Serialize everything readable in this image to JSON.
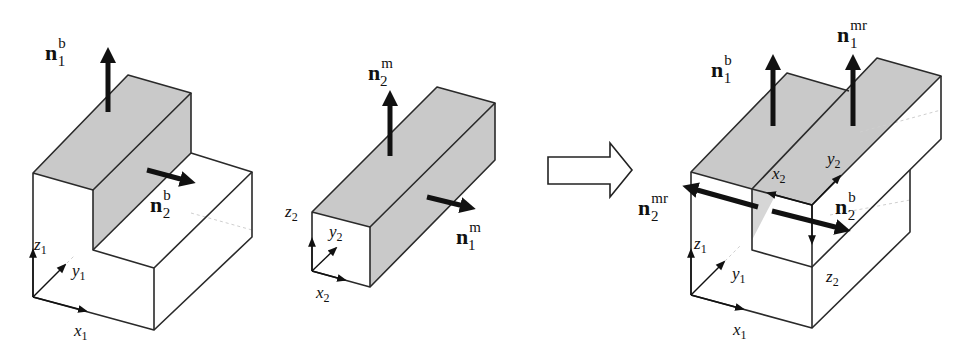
{
  "figure": {
    "left": {
      "name": "base body b",
      "labels": {
        "n1": {
          "base": "n",
          "sub": "1",
          "sup": "b"
        },
        "n2": {
          "base": "n",
          "sub": "2",
          "sup": "b"
        },
        "x": {
          "base": "x",
          "sub": "1"
        },
        "y": {
          "base": "y",
          "sub": "1"
        },
        "z": {
          "base": "z",
          "sub": "1"
        }
      }
    },
    "middle": {
      "name": "mating body m",
      "labels": {
        "n2": {
          "base": "n",
          "sub": "2",
          "sup": "m"
        },
        "n1": {
          "base": "n",
          "sub": "1",
          "sup": "m"
        },
        "x": {
          "base": "x",
          "sub": "2"
        },
        "y": {
          "base": "y",
          "sub": "2"
        },
        "z": {
          "base": "z",
          "sub": "2"
        }
      }
    },
    "transition_arrow": "block-right-arrow",
    "right": {
      "name": "assembled bodies",
      "labels": {
        "n1b": {
          "base": "n",
          "sub": "1",
          "sup": "b"
        },
        "n1mr": {
          "base": "n",
          "sub": "1",
          "sup": "mr"
        },
        "n2mr": {
          "base": "n",
          "sub": "2",
          "sup": "mr"
        },
        "n2b": {
          "base": "n",
          "sub": "2",
          "sup": "b"
        },
        "x1": {
          "base": "x",
          "sub": "1"
        },
        "y1": {
          "base": "y",
          "sub": "1"
        },
        "z1": {
          "base": "z",
          "sub": "1"
        },
        "x2": {
          "base": "x",
          "sub": "2"
        },
        "y2": {
          "base": "y",
          "sub": "2"
        },
        "z2": {
          "base": "z",
          "sub": "2"
        }
      }
    },
    "colors": {
      "shaded_face": "#c9c9c9",
      "edge": "#2a2a2a",
      "vector": "#111111"
    }
  }
}
